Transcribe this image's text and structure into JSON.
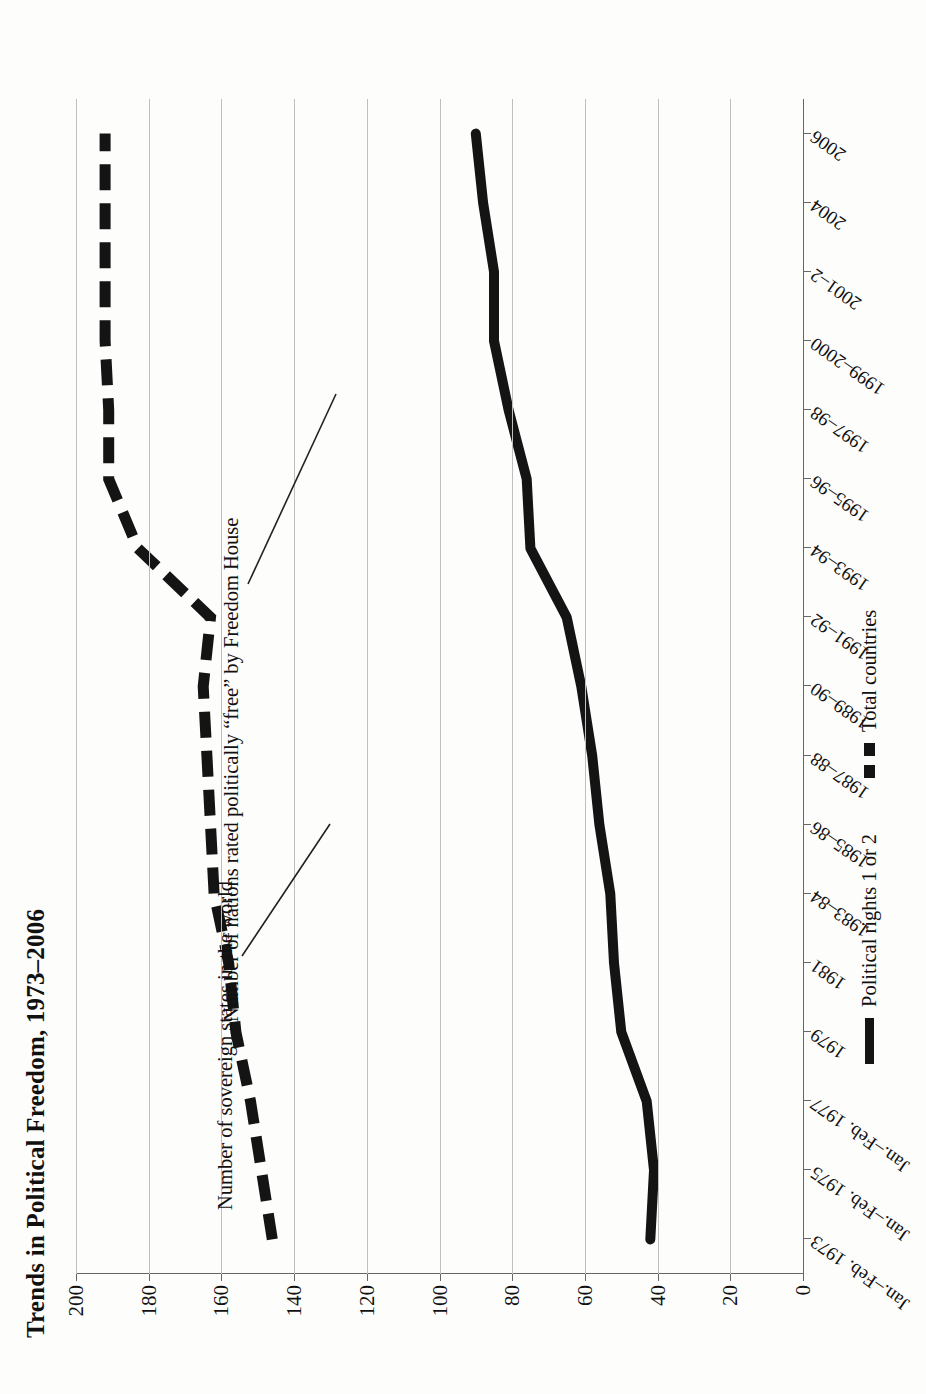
{
  "figure": {
    "title": "Trends in Political Freedom, 1973–2006",
    "rotation": "90deg-ccw",
    "background": "#fdfdfc",
    "ink_color": "#141414",
    "grid_color": "#bfbfbf"
  },
  "annotations": [
    {
      "name": "total-countries-annotation",
      "text": "Number of sovereign states in the world"
    },
    {
      "name": "free-nations-annotation",
      "text": "Number of nations rated politically “free” by Freedom House"
    }
  ],
  "legend": {
    "position": "bottom",
    "items": [
      {
        "label": "Political rights 1 or 2",
        "style": "solid",
        "color": "#141414",
        "swatch": "solid-line-swatch"
      },
      {
        "label": "Total countries",
        "style": "dashed",
        "color": "#141414",
        "swatch": "dashed-line-swatch"
      }
    ]
  },
  "chart_data": {
    "type": "line",
    "title": "Trends in Political Freedom, 1973–2006",
    "xlabel": "",
    "ylabel": "",
    "ylim": [
      0,
      200
    ],
    "yticks": [
      0,
      20,
      40,
      60,
      80,
      100,
      120,
      140,
      160,
      180,
      200
    ],
    "ytick_labels": [
      "0",
      "20",
      "40",
      "60",
      "80",
      "100",
      "120",
      "140",
      "160",
      "180",
      "200"
    ],
    "grid": "horizontal-only (value axis gridlines)",
    "legend_position": "bottom",
    "categories": [
      "Jan.–Feb. 1973",
      "Jan.–Feb. 1975",
      "Jan.–Feb. 1977",
      "1979",
      "1981",
      "1983–84",
      "1985–86",
      "1987–88",
      "1989–90",
      "1991–92",
      "1993–94",
      "1995–96",
      "1997–98",
      "1999–2000",
      "2001–2",
      "2004",
      "2006"
    ],
    "series": [
      {
        "name": "Total countries",
        "style": "dashed",
        "annotation": "Number of sovereign states in the world",
        "values": [
          146,
          149,
          152,
          156,
          158,
          162,
          163,
          164,
          165,
          163,
          183,
          191,
          191,
          192,
          192,
          192,
          192
        ]
      },
      {
        "name": "Political rights 1 or 2",
        "style": "solid",
        "annotation": "Number of nations rated politically “free” by Freedom House",
        "values": [
          42,
          41,
          43,
          50,
          52,
          53,
          56,
          58,
          61,
          65,
          75,
          76,
          81,
          85,
          85,
          88,
          90
        ]
      }
    ]
  }
}
